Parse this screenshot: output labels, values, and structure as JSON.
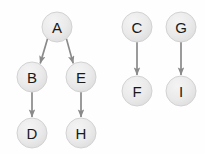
{
  "diagram": {
    "type": "directed-graph",
    "title": "",
    "background_color": "#fefefe",
    "node_fill_color": "#e6e6e6",
    "node_stroke_color": "#d2d2d2",
    "node_label_color": "#1a1a1a",
    "edge_color": "#8a8a8a",
    "node_radius": 15,
    "nodes": [
      {
        "id": "A",
        "label": "A",
        "cx": 57,
        "cy": 27
      },
      {
        "id": "B",
        "label": "B",
        "cx": 32,
        "cy": 77
      },
      {
        "id": "E",
        "label": "E",
        "cx": 81,
        "cy": 77
      },
      {
        "id": "D",
        "label": "D",
        "cx": 32,
        "cy": 133
      },
      {
        "id": "H",
        "label": "H",
        "cx": 81,
        "cy": 133
      },
      {
        "id": "C",
        "label": "C",
        "cx": 137,
        "cy": 27
      },
      {
        "id": "F",
        "label": "F",
        "cx": 137,
        "cy": 91
      },
      {
        "id": "G",
        "label": "G",
        "cx": 181,
        "cy": 27
      },
      {
        "id": "I",
        "label": "I",
        "cx": 181,
        "cy": 91
      }
    ],
    "edges": [
      {
        "from": "A",
        "to": "B",
        "directed": true
      },
      {
        "from": "A",
        "to": "E",
        "directed": true
      },
      {
        "from": "B",
        "to": "D",
        "directed": true
      },
      {
        "from": "E",
        "to": "H",
        "directed": true
      },
      {
        "from": "C",
        "to": "F",
        "directed": true
      },
      {
        "from": "G",
        "to": "I",
        "directed": true
      }
    ],
    "components": [
      {
        "name": "component-1",
        "members": [
          "A",
          "B",
          "E",
          "D",
          "H"
        ]
      },
      {
        "name": "component-2",
        "members": [
          "C",
          "F"
        ]
      },
      {
        "name": "component-3",
        "members": [
          "G",
          "I"
        ]
      }
    ]
  }
}
